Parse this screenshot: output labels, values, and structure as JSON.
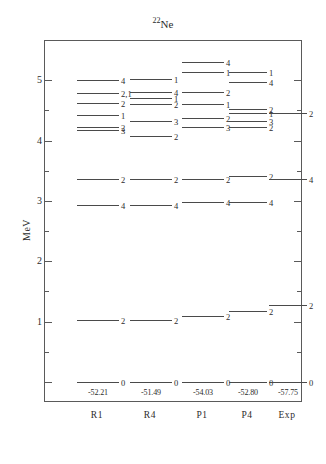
{
  "figure": {
    "title_mass": "22",
    "title_element": "Ne",
    "y_axis_label": "MeV",
    "y_ticks": [
      "1",
      "2",
      "3",
      "4",
      "5"
    ]
  },
  "chart_data": {
    "type": "scatter",
    "title": "22Ne",
    "xlabel": "",
    "ylabel": "MeV",
    "ylim": [
      -0.35,
      5.65
    ],
    "grid": false,
    "legend": "none",
    "categories": [
      "R1",
      "R4",
      "P1",
      "P4",
      "Exp"
    ],
    "series": [
      {
        "name": "R1",
        "ground_state_energy": "-52.21",
        "levels": [
          {
            "energy": 0.0,
            "label": "0"
          },
          {
            "energy": 1.03,
            "label": "2"
          },
          {
            "energy": 2.93,
            "label": "4"
          },
          {
            "energy": 3.37,
            "label": "2"
          },
          {
            "energy": 4.17,
            "label": "3"
          },
          {
            "energy": 4.23,
            "label": "2"
          },
          {
            "energy": 4.42,
            "label": "1"
          },
          {
            "energy": 4.63,
            "label": "2"
          },
          {
            "energy": 4.78,
            "label": "2,1"
          },
          {
            "energy": 5.0,
            "label": "4"
          }
        ]
      },
      {
        "name": "R4",
        "ground_state_energy": "-51.49",
        "levels": [
          {
            "energy": 0.0,
            "label": "0"
          },
          {
            "energy": 1.03,
            "label": "2"
          },
          {
            "energy": 2.93,
            "label": "4"
          },
          {
            "energy": 3.37,
            "label": "2"
          },
          {
            "energy": 4.08,
            "label": "2"
          },
          {
            "energy": 4.32,
            "label": "3"
          },
          {
            "energy": 4.6,
            "label": "2"
          },
          {
            "energy": 4.7,
            "label": "1"
          },
          {
            "energy": 4.8,
            "label": "4"
          },
          {
            "energy": 5.02,
            "label": "1"
          }
        ]
      },
      {
        "name": "P1",
        "ground_state_energy": "-54.03",
        "levels": [
          {
            "energy": 0.0,
            "label": "0"
          },
          {
            "energy": 1.1,
            "label": "2"
          },
          {
            "energy": 2.98,
            "label": "4"
          },
          {
            "energy": 3.37,
            "label": "2"
          },
          {
            "energy": 4.22,
            "label": "3"
          },
          {
            "energy": 4.37,
            "label": "2"
          },
          {
            "energy": 4.6,
            "label": "1"
          },
          {
            "energy": 4.8,
            "label": "2"
          },
          {
            "energy": 5.13,
            "label": "1"
          },
          {
            "energy": 5.3,
            "label": "4"
          }
        ]
      },
      {
        "name": "P4",
        "ground_state_energy": "-52.80",
        "levels": [
          {
            "energy": 0.0,
            "label": "0"
          },
          {
            "energy": 1.17,
            "label": "2"
          },
          {
            "energy": 2.98,
            "label": "4"
          },
          {
            "energy": 3.42,
            "label": "2"
          },
          {
            "energy": 4.22,
            "label": "2"
          },
          {
            "energy": 4.33,
            "label": "3"
          },
          {
            "energy": 4.45,
            "label": "1"
          },
          {
            "energy": 4.53,
            "label": "2"
          },
          {
            "energy": 4.97,
            "label": "4"
          },
          {
            "energy": 5.13,
            "label": "1"
          }
        ]
      },
      {
        "name": "Exp",
        "ground_state_energy": "-57.75",
        "levels": [
          {
            "energy": 0.0,
            "label": "0"
          },
          {
            "energy": 1.27,
            "label": "2"
          },
          {
            "energy": 3.37,
            "label": "4"
          },
          {
            "energy": 4.45,
            "label": "2"
          }
        ]
      }
    ]
  }
}
